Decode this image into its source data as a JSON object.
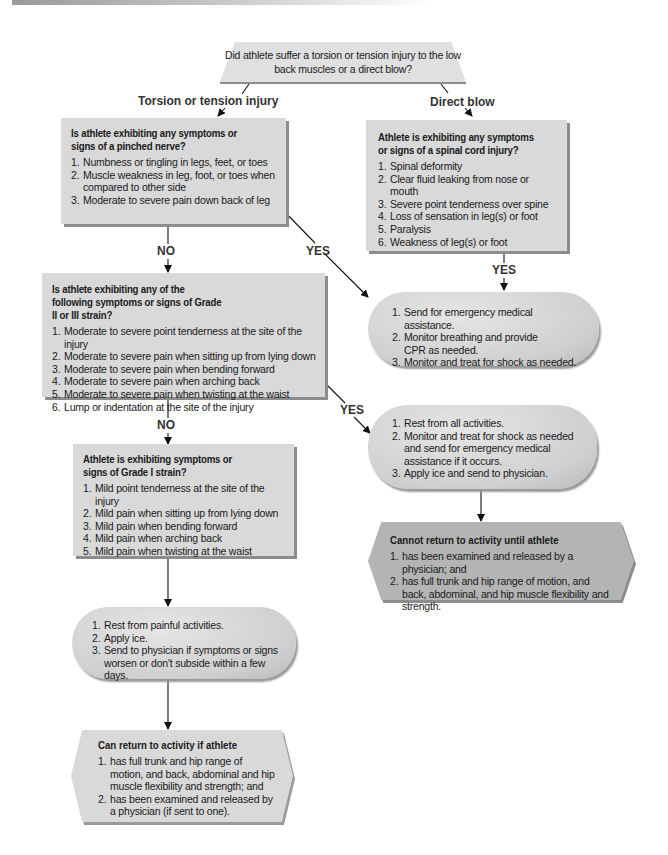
{
  "start": {
    "question": "Did athlete suffer a torsion or tension injury to the low back muscles or a direct blow?"
  },
  "branches": {
    "torsion": "Torsion or tension injury",
    "direct": "Direct blow"
  },
  "labels": {
    "yes": "YES",
    "no": "NO"
  },
  "pinched_nerve": {
    "title": "Is athlete exhibiting any symptoms or signs of a pinched nerve?",
    "items": [
      {
        "num": "1.",
        "text": "Numbness or tingling in legs, feet, or toes"
      },
      {
        "num": "2.",
        "text": "Muscle weakness in leg, foot, or toes when compared to other side"
      },
      {
        "num": "3.",
        "text": "Moderate to severe pain down back of leg"
      }
    ]
  },
  "spinal_cord": {
    "title": "Athlete is exhibiting any symptoms or signs of a spinal cord injury?",
    "items": [
      {
        "num": "1.",
        "text": "Spinal deformity"
      },
      {
        "num": "2.",
        "text": "Clear fluid leaking from nose or mouth"
      },
      {
        "num": "3.",
        "text": "Severe point tenderness over spine"
      },
      {
        "num": "4.",
        "text": "Loss of sensation in leg(s) or foot"
      },
      {
        "num": "5.",
        "text": "Paralysis"
      },
      {
        "num": "6.",
        "text": "Weakness of leg(s) or foot"
      }
    ]
  },
  "emergency": {
    "items": [
      {
        "num": "1.",
        "text": "Send for emergency medical assistance."
      },
      {
        "num": "2.",
        "text": "Monitor breathing and provide CPR as needed."
      },
      {
        "num": "3.",
        "text": "Monitor and treat for shock as needed."
      }
    ]
  },
  "grade2_3": {
    "title": "Is athlete exhibiting any of the following symptoms or signs of Grade II or III strain?",
    "items": [
      {
        "num": "1.",
        "text": "Moderate to severe point tenderness at the site of the injury"
      },
      {
        "num": "2.",
        "text": "Moderate to severe pain when sitting up from lying down"
      },
      {
        "num": "3.",
        "text": "Moderate to severe pain when bending forward"
      },
      {
        "num": "4.",
        "text": "Moderate to severe pain when arching back"
      },
      {
        "num": "5.",
        "text": "Moderate to severe pain when twisting at the waist"
      },
      {
        "num": "6.",
        "text": "Lump or indentation at the site of the injury"
      }
    ]
  },
  "grade2_3_action": {
    "items": [
      {
        "num": "1.",
        "text": "Rest from all activities."
      },
      {
        "num": "2.",
        "text": "Monitor and treat for shock as needed and send for emergency medical assistance if it occurs."
      },
      {
        "num": "3.",
        "text": "Apply ice and send to physician."
      }
    ]
  },
  "cannot_return": {
    "title": "Cannot return to activity until athlete",
    "items": [
      {
        "num": "1.",
        "text": "has been examined and released by a physician; and"
      },
      {
        "num": "2.",
        "text": "has full trunk and hip range of motion, and back, abdominal, and hip muscle flexibility and strength."
      }
    ]
  },
  "grade1": {
    "title": "Athlete is exhibiting symptoms or signs of Grade I strain?",
    "items": [
      {
        "num": "1.",
        "text": "Mild point tenderness at the site of the injury"
      },
      {
        "num": "2.",
        "text": "Mild pain when sitting up from lying down"
      },
      {
        "num": "3.",
        "text": "Mild pain when bending forward"
      },
      {
        "num": "4.",
        "text": "Mild pain when arching back"
      },
      {
        "num": "5.",
        "text": "Mild pain when twisting at the waist"
      }
    ]
  },
  "grade1_action": {
    "items": [
      {
        "num": "1.",
        "text": "Rest from painful activities."
      },
      {
        "num": "2.",
        "text": "Apply ice."
      },
      {
        "num": "3.",
        "text": "Send to physician if symptoms or signs worsen or don't subside within a few days."
      }
    ]
  },
  "can_return": {
    "title": "Can return to activity if athlete",
    "items": [
      {
        "num": "1.",
        "text": "has full trunk and hip range of motion, and back, abdominal and hip muscle flexibility and strength; and"
      },
      {
        "num": "2.",
        "text": "has been examined and released by a physician (if sent to one)."
      }
    ]
  },
  "colors": {
    "box_fill": "#d9d9d9",
    "box_shadow": "#8c8c8c",
    "hex_dark": "#b4b4b4",
    "text": "#1a1a1a"
  }
}
